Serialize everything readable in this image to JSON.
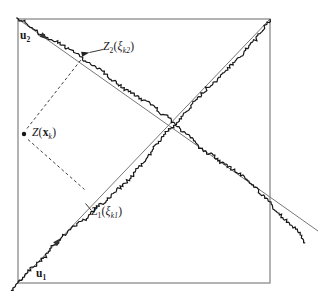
{
  "figure": {
    "colors": {
      "background": "#ffffff",
      "ink": "#161616",
      "frame": "#8a8a8a",
      "axis": "#777777",
      "dash": "#3f3f3f",
      "arrow": "#333333",
      "leader": "#222222"
    },
    "frame": {
      "x": 18,
      "y": 19,
      "w": 252,
      "h": 264
    },
    "axes": [
      {
        "name": "turning-band-line-u1",
        "x1": 18,
        "y1": 283,
        "x2": 270,
        "y2": 19
      },
      {
        "name": "turning-band-line-u2",
        "x1": 18,
        "y1": 19,
        "x2": 318,
        "y2": 231
      }
    ],
    "axis_arrowheads": [
      {
        "name": "u2-direction-arrowhead",
        "x": 48,
        "y": 39.5,
        "angle": 35.3
      },
      {
        "name": "u1-direction-arrowhead",
        "x": 61,
        "y": 238,
        "angle": -46.3
      }
    ],
    "dashed_projections": [
      {
        "name": "projection-to-u2-dash",
        "x1": 27,
        "y1": 128.5,
        "x2": 82,
        "y2": 58.5
      },
      {
        "name": "projection-to-u1-dash",
        "x1": 28,
        "y1": 139.5,
        "x2": 84.5,
        "y2": 189.5
      }
    ],
    "point_marker": {
      "cx": 24,
      "cy": 134,
      "r": 2.2
    },
    "label_leaders": [
      {
        "name": "z2-label-leader",
        "x1": 103,
        "y1": 49.5,
        "x2": 89.5,
        "y2": 52.5,
        "arrow": true
      },
      {
        "name": "z1-label-leader",
        "x1": 91,
        "y1": 210,
        "x2": 85.5,
        "y2": 203.5,
        "arrow": false
      }
    ],
    "random_walks": [
      {
        "name": "simulated-process-walk-u1",
        "x1": 18,
        "y1": 283,
        "x2": 270,
        "y2": 19,
        "t0": -0.028,
        "t1": 1.0,
        "segments": 256,
        "amp": 16,
        "decay": 0.55,
        "jitter": 1.6,
        "startOffset": 0,
        "endOffset": 0,
        "seed": 20
      },
      {
        "name": "simulated-process-walk-u2",
        "x1": 18,
        "y1": 19,
        "x2": 318,
        "y2": 231,
        "t0": -0.006,
        "t1": 0.99,
        "segments": 256,
        "amp": 16,
        "decay": 0.55,
        "jitter": 1.6,
        "startOffset": 0,
        "endOffset": 17,
        "seed": 87
      }
    ]
  },
  "labels": {
    "u2": {
      "base": "u",
      "sub": "2"
    },
    "z2": {
      "name": "Z",
      "name_sub": "2",
      "open": "(",
      "arg": "ξ",
      "arg_sub": "k2",
      "close": ")"
    },
    "zx": {
      "name": "Z",
      "open": "(",
      "arg": "x",
      "arg_sub": "k",
      "close": ")"
    },
    "z1": {
      "name": "Z",
      "name_sub": "1",
      "open": "(",
      "arg": "ξ",
      "arg_sub": "k1",
      "close": ")"
    },
    "u1": {
      "base": "u",
      "sub": "1"
    }
  }
}
